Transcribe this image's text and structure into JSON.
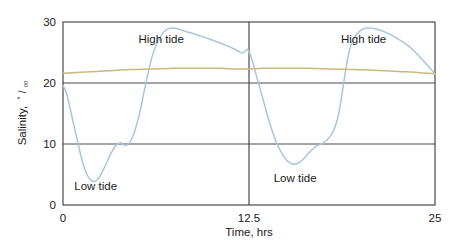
{
  "chart_data": {
    "type": "line",
    "title": "",
    "xlabel": "Time, hrs",
    "ylabel": "Salinity, °/₀₀",
    "ylabel_text": "Salinity,",
    "ylabel_unit_numerator": "°",
    "ylabel_unit_slash": "/",
    "ylabel_unit_denominator": "₀₀",
    "xlim": [
      0,
      25
    ],
    "ylim": [
      0,
      30
    ],
    "xticks": [
      0,
      12.5,
      25
    ],
    "xtick_labels": [
      "0",
      "12.5",
      "25"
    ],
    "yticks": [
      0,
      10,
      20,
      30
    ],
    "ytick_labels": [
      "0",
      "10",
      "20",
      "30"
    ],
    "grid": "horizontal gridlines at y=10 and y=20; vertical gridline at x=12.5",
    "legend": "none; curves labelled inline by annotations",
    "annotations": [
      {
        "text": "High tide",
        "x": 6.6,
        "y": 27.2
      },
      {
        "text": "Low tide",
        "x": 2.2,
        "y": 3.1
      },
      {
        "text": "High tide",
        "x": 20.2,
        "y": 27.2
      },
      {
        "text": "Low tide",
        "x": 15.6,
        "y": 4.4
      }
    ],
    "series": [
      {
        "name": "Tidal salinity",
        "color": "#a9c5dd",
        "points": [
          [
            0.0,
            19.6
          ],
          [
            0.25,
            18.2
          ],
          [
            0.5,
            15.6
          ],
          [
            0.75,
            12.8
          ],
          [
            1.0,
            10.2
          ],
          [
            1.25,
            7.6
          ],
          [
            1.5,
            5.6
          ],
          [
            1.75,
            4.4
          ],
          [
            2.0,
            3.9
          ],
          [
            2.25,
            4.0
          ],
          [
            2.5,
            4.8
          ],
          [
            2.75,
            6.0
          ],
          [
            3.0,
            7.3
          ],
          [
            3.25,
            8.6
          ],
          [
            3.5,
            9.6
          ],
          [
            3.75,
            10.1
          ],
          [
            3.9,
            10.2
          ],
          [
            4.05,
            9.9
          ],
          [
            4.25,
            9.8
          ],
          [
            4.5,
            10.3
          ],
          [
            4.75,
            11.6
          ],
          [
            5.0,
            13.6
          ],
          [
            5.25,
            16.2
          ],
          [
            5.5,
            19.2
          ],
          [
            5.75,
            22.0
          ],
          [
            6.0,
            24.4
          ],
          [
            6.25,
            26.2
          ],
          [
            6.5,
            27.4
          ],
          [
            6.75,
            28.3
          ],
          [
            7.0,
            28.8
          ],
          [
            7.4,
            29.0
          ],
          [
            7.8,
            28.8
          ],
          [
            8.3,
            28.4
          ],
          [
            8.9,
            28.0
          ],
          [
            9.6,
            27.4
          ],
          [
            10.3,
            26.8
          ],
          [
            10.9,
            26.2
          ],
          [
            11.4,
            25.7
          ],
          [
            11.8,
            25.2
          ],
          [
            12.05,
            24.9
          ],
          [
            12.2,
            25.1
          ],
          [
            12.35,
            25.5
          ],
          [
            12.45,
            25.4
          ],
          [
            12.6,
            24.6
          ],
          [
            12.8,
            23.0
          ],
          [
            13.0,
            21.2
          ],
          [
            13.25,
            19.0
          ],
          [
            13.5,
            16.8
          ],
          [
            13.75,
            14.6
          ],
          [
            14.0,
            12.6
          ],
          [
            14.25,
            10.8
          ],
          [
            14.5,
            9.4
          ],
          [
            14.75,
            8.3
          ],
          [
            15.0,
            7.4
          ],
          [
            15.25,
            6.9
          ],
          [
            15.5,
            6.7
          ],
          [
            15.75,
            6.8
          ],
          [
            16.0,
            7.2
          ],
          [
            16.25,
            7.8
          ],
          [
            16.5,
            8.5
          ],
          [
            16.75,
            9.1
          ],
          [
            17.0,
            9.6
          ],
          [
            17.25,
            9.9
          ],
          [
            17.5,
            10.2
          ],
          [
            17.75,
            10.7
          ],
          [
            18.0,
            11.4
          ],
          [
            18.25,
            12.6
          ],
          [
            18.5,
            14.6
          ],
          [
            18.7,
            17.4
          ],
          [
            18.9,
            20.6
          ],
          [
            19.1,
            23.6
          ],
          [
            19.3,
            25.8
          ],
          [
            19.55,
            27.3
          ],
          [
            19.85,
            28.3
          ],
          [
            20.2,
            28.9
          ],
          [
            20.6,
            29.0
          ],
          [
            21.1,
            28.8
          ],
          [
            21.7,
            28.3
          ],
          [
            22.4,
            27.4
          ],
          [
            23.1,
            26.3
          ],
          [
            23.7,
            25.0
          ],
          [
            24.2,
            23.7
          ],
          [
            24.6,
            22.6
          ],
          [
            25.0,
            21.5
          ]
        ]
      },
      {
        "name": "Reference salinity",
        "color": "#c9b97c",
        "points": [
          [
            0.0,
            21.6
          ],
          [
            1.5,
            21.8
          ],
          [
            3.0,
            22.0
          ],
          [
            4.5,
            22.2
          ],
          [
            6.0,
            22.3
          ],
          [
            7.5,
            22.4
          ],
          [
            9.0,
            22.4
          ],
          [
            10.5,
            22.4
          ],
          [
            12.0,
            22.3
          ],
          [
            13.5,
            22.4
          ],
          [
            15.0,
            22.4
          ],
          [
            16.5,
            22.4
          ],
          [
            18.0,
            22.3
          ],
          [
            19.5,
            22.2
          ],
          [
            21.0,
            22.1
          ],
          [
            22.5,
            21.9
          ],
          [
            24.0,
            21.7
          ],
          [
            25.0,
            21.5
          ]
        ]
      }
    ]
  },
  "style": {
    "axis_color": "#4a4a4a",
    "text_color": "#1a1a1a",
    "background": "#ffffff"
  }
}
